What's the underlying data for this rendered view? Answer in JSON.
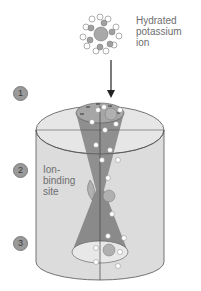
{
  "diagram": {
    "hydrated_ion_label": [
      "Hydrated",
      "potassium",
      "ion"
    ],
    "binding_site_label": [
      "Ion-",
      "binding",
      "site"
    ],
    "ion_symbol": "K+",
    "steps": [
      "1",
      "2",
      "3"
    ],
    "charge_symbols": "−",
    "colors": {
      "membrane": "#d8d8d8",
      "pore": "#9a9a9a",
      "pore_dark": "#7d7d7d",
      "outline": "#555555",
      "water": "#ffffff",
      "ion": "#a8a8a8",
      "label": "#6e6e6e"
    }
  }
}
